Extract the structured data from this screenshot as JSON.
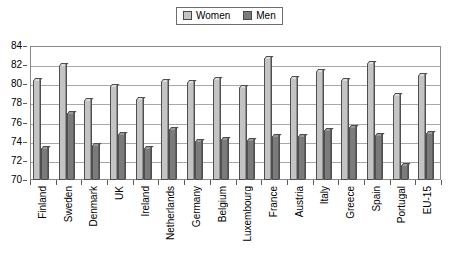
{
  "chart_data": {
    "type": "bar",
    "title": "",
    "subtitle": "",
    "xlabel": "",
    "ylabel": "",
    "ylim": [
      70,
      84
    ],
    "y_ticks": [
      70,
      72,
      74,
      76,
      78,
      80,
      82,
      84
    ],
    "grid": true,
    "legend_position": "top-center",
    "categories": [
      "Finland",
      "Sweden",
      "Denmark",
      "UK",
      "Ireland",
      "Netherlands",
      "Germany",
      "Belgium",
      "Luxembourg",
      "France",
      "Austria",
      "Italy",
      "Greece",
      "Spain",
      "Portugal",
      "EU-15"
    ],
    "series": [
      {
        "name": "Women",
        "color": "#c4c4c4",
        "values": [
          80.4,
          82.0,
          78.4,
          79.8,
          78.5,
          80.3,
          80.2,
          80.6,
          79.7,
          82.7,
          80.7,
          81.4,
          80.5,
          82.2,
          78.9,
          81.0
        ]
      },
      {
        "name": "Men",
        "color": "#7b7b7b",
        "values": [
          73.3,
          77.0,
          73.7,
          74.8,
          73.3,
          75.3,
          74.1,
          74.3,
          74.2,
          74.6,
          74.6,
          75.2,
          75.5,
          74.7,
          71.6,
          74.9
        ]
      }
    ]
  },
  "legend": {
    "entries": [
      {
        "label": "Women",
        "swatch": "legend-swatch-women"
      },
      {
        "label": "Men",
        "swatch": "legend-swatch-men"
      }
    ]
  }
}
